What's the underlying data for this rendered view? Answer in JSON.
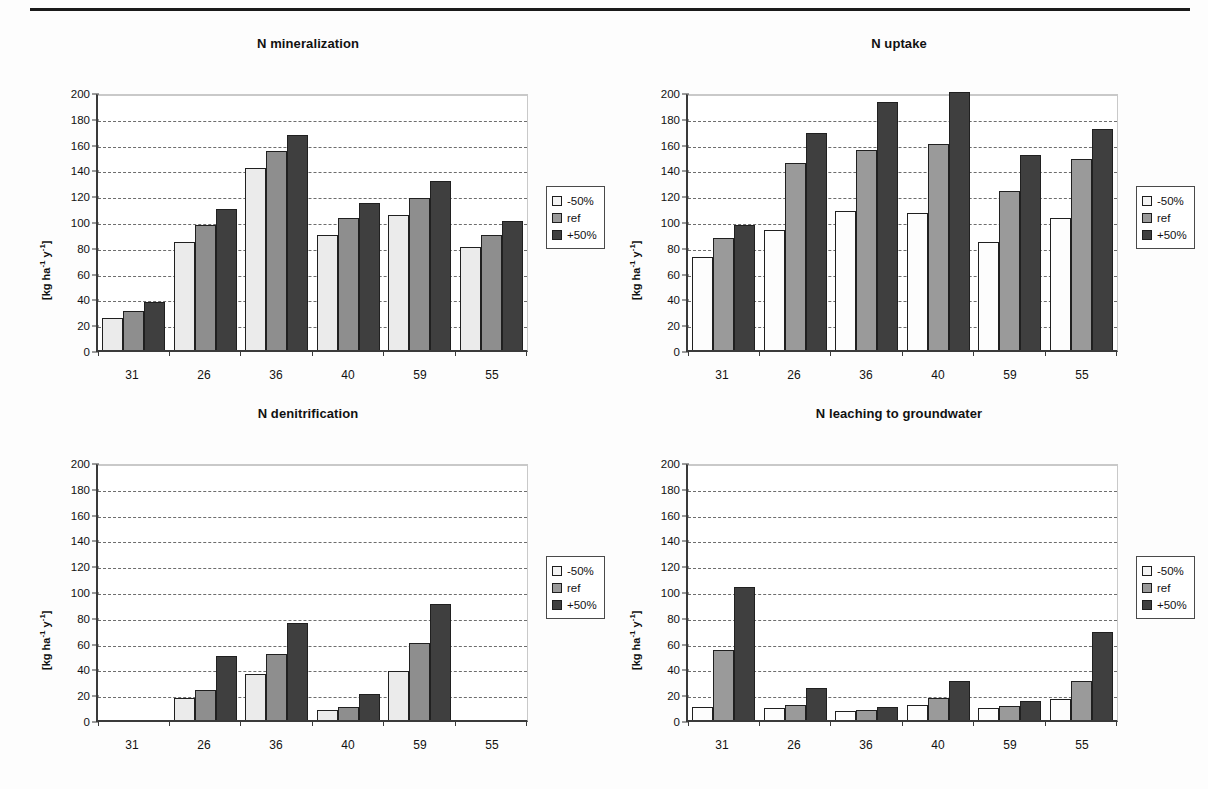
{
  "page": {
    "width": 1208,
    "height": 789
  },
  "axis": {
    "y_ticks": [
      0,
      20,
      40,
      60,
      80,
      100,
      120,
      140,
      160,
      180,
      200
    ],
    "y_label": "[kg ha-1 y-1]",
    "y_label_parts": {
      "prefix": "[kg ha",
      "sup1": "-1",
      "mid": " y",
      "sup2": "-1",
      "suffix": "]"
    },
    "ylim": [
      0,
      200
    ],
    "categories": [
      "31",
      "26",
      "36",
      "40",
      "59",
      "55"
    ]
  },
  "legend": {
    "position": "right",
    "entries": [
      {
        "label": "-50%",
        "color": "#f4f4f4",
        "key": "minus50"
      },
      {
        "label": "ref",
        "color": "#9a9a9a",
        "key": "ref"
      },
      {
        "label": "+50%",
        "color": "#3f3f3f",
        "key": "plus50"
      }
    ]
  },
  "chart_data": [
    {
      "id": "n-mineralization",
      "type": "bar",
      "title": "N mineralization",
      "xlabel": "",
      "ylabel": "[kg ha-1 y-1]",
      "ylim": [
        0,
        200
      ],
      "grid": true,
      "categories": [
        "31",
        "26",
        "36",
        "40",
        "59",
        "55"
      ],
      "series": [
        {
          "name": "-50%",
          "values": [
            25,
            84,
            141,
            89,
            105,
            80
          ]
        },
        {
          "name": "ref",
          "values": [
            30,
            97,
            154,
            102,
            118,
            89
          ]
        },
        {
          "name": "+50%",
          "values": [
            37,
            109,
            167,
            114,
            131,
            100
          ]
        }
      ]
    },
    {
      "id": "n-uptake",
      "type": "bar",
      "title": "N uptake",
      "xlabel": "",
      "ylabel": "[kg ha-1 y-1]",
      "ylim": [
        0,
        200
      ],
      "grid": true,
      "categories": [
        "31",
        "26",
        "36",
        "40",
        "59",
        "55"
      ],
      "series": [
        {
          "name": "-50%",
          "values": [
            72,
            93,
            108,
            106,
            84,
            102
          ]
        },
        {
          "name": "ref",
          "values": [
            87,
            145,
            155,
            160,
            123,
            148
          ]
        },
        {
          "name": "+50%",
          "values": [
            97,
            168,
            192,
            200,
            151,
            171
          ]
        }
      ]
    },
    {
      "id": "n-denitrification",
      "type": "bar",
      "title": "N denitrification",
      "xlabel": "",
      "ylabel": "[kg ha-1 y-1]",
      "ylim": [
        0,
        200
      ],
      "grid": true,
      "categories": [
        "31",
        "26",
        "36",
        "40",
        "59",
        "55"
      ],
      "series": [
        {
          "name": "-50%",
          "values": [
            0,
            17,
            36,
            8,
            38,
            0
          ]
        },
        {
          "name": "ref",
          "values": [
            0,
            23,
            51,
            10,
            60,
            0
          ]
        },
        {
          "name": "+50%",
          "values": [
            0,
            50,
            75,
            20,
            90,
            0
          ]
        }
      ]
    },
    {
      "id": "n-leaching-to-groundwater",
      "type": "bar",
      "title": "N leaching to groundwater",
      "xlabel": "",
      "ylabel": "[kg ha-1 y-1]",
      "ylim": [
        0,
        200
      ],
      "grid": true,
      "categories": [
        "31",
        "26",
        "36",
        "40",
        "59",
        "55"
      ],
      "series": [
        {
          "name": "-50%",
          "values": [
            10,
            9,
            7,
            12,
            9,
            16
          ]
        },
        {
          "name": "ref",
          "values": [
            54,
            12,
            8,
            17,
            11,
            30
          ]
        },
        {
          "name": "+50%",
          "values": [
            103,
            25,
            10,
            30,
            15,
            68
          ]
        }
      ]
    }
  ]
}
